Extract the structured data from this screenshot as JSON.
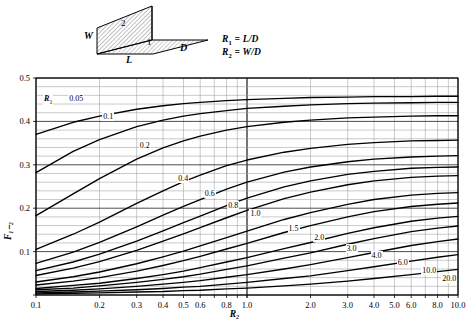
{
  "schematic": {
    "labels": [
      {
        "name": "width-label",
        "text": "W",
        "x": 88,
        "y": 31
      },
      {
        "name": "length-label",
        "text": "L",
        "x": 147,
        "y": 56
      },
      {
        "name": "depth-label",
        "text": "D",
        "x": 196,
        "y": 43
      },
      {
        "name": "surface-2-number",
        "text": "2",
        "x": 131,
        "y": 19
      },
      {
        "name": "surface-1-number",
        "text": "1",
        "x": 160,
        "y": 36
      }
    ],
    "equation_1": "R",
    "equation_1_sub": "1",
    "equation_1_rhs": " = L/D",
    "equation_2": "R",
    "equation_2_sub": "2",
    "equation_2_rhs": " = W/D",
    "hatch_color": "#7a7a7a",
    "outline_color": "#000000"
  },
  "chart_data": {
    "type": "line",
    "title": "",
    "xlabel": "R₂",
    "ylabel": "F₁₋₂",
    "xscale": "log",
    "yscale": "linear",
    "xlim": [
      0.1,
      10.0
    ],
    "ylim": [
      0.0,
      0.5
    ],
    "grid": true,
    "legend_position": "inline-curve-labels",
    "x_tick_labels": [
      "0.1",
      "0.2",
      "0.3",
      "0.4",
      "0.5",
      "0.6",
      "0.8",
      "1.0",
      "2.0",
      "3.0",
      "4.0",
      "5.0",
      "6.0",
      "8.0",
      "10.0"
    ],
    "x_tick_values": [
      0.1,
      0.2,
      0.3,
      0.4,
      0.5,
      0.6,
      0.8,
      1.0,
      2.0,
      3.0,
      4.0,
      5.0,
      6.0,
      8.0,
      10.0
    ],
    "y_tick_labels": [
      "0",
      "0.1",
      "0.2",
      "0.3",
      "0.4",
      "0.5"
    ],
    "y_tick_values": [
      0,
      0.1,
      0.2,
      0.3,
      0.4,
      0.5
    ],
    "y_minor_step": 0.02,
    "parameter_name": "R₁",
    "series": [
      {
        "name": "0.05",
        "R1": 0.05,
        "label": "0.05",
        "label_x": 0.155,
        "label_y": 0.452,
        "x": [
          0.1,
          0.15,
          0.2,
          0.3,
          0.4,
          0.5,
          0.6,
          0.8,
          1.0,
          1.5,
          2.0,
          3.0,
          4.0,
          6.0,
          8.0,
          10.0
        ],
        "values": [
          0.37,
          0.398,
          0.412,
          0.428,
          0.436,
          0.441,
          0.444,
          0.448,
          0.45,
          0.453,
          0.455,
          0.456,
          0.457,
          0.457,
          0.458,
          0.458
        ]
      },
      {
        "name": "0.1",
        "R1": 0.1,
        "label": "0.1",
        "label_x": 0.225,
        "label_y": 0.41,
        "x": [
          0.1,
          0.15,
          0.2,
          0.3,
          0.4,
          0.5,
          0.6,
          0.8,
          1.0,
          1.5,
          2.0,
          3.0,
          4.0,
          6.0,
          8.0,
          10.0
        ],
        "values": [
          0.282,
          0.331,
          0.358,
          0.388,
          0.403,
          0.412,
          0.418,
          0.425,
          0.43,
          0.435,
          0.438,
          0.441,
          0.442,
          0.443,
          0.444,
          0.444
        ]
      },
      {
        "name": "0.2",
        "R1": 0.2,
        "label": "0.2",
        "label_x": 0.335,
        "label_y": 0.344,
        "x": [
          0.1,
          0.15,
          0.2,
          0.3,
          0.4,
          0.5,
          0.6,
          0.8,
          1.0,
          1.5,
          2.0,
          3.0,
          4.0,
          6.0,
          8.0,
          10.0
        ],
        "values": [
          0.183,
          0.233,
          0.268,
          0.313,
          0.339,
          0.355,
          0.366,
          0.38,
          0.388,
          0.398,
          0.403,
          0.408,
          0.41,
          0.412,
          0.413,
          0.413
        ]
      },
      {
        "name": "0.4",
        "R1": 0.4,
        "label": "0.4",
        "label_x": 0.51,
        "label_y": 0.268,
        "x": [
          0.1,
          0.15,
          0.2,
          0.3,
          0.4,
          0.5,
          0.6,
          0.8,
          1.0,
          1.5,
          2.0,
          3.0,
          4.0,
          6.0,
          8.0,
          10.0
        ],
        "values": [
          0.105,
          0.14,
          0.168,
          0.211,
          0.24,
          0.261,
          0.276,
          0.298,
          0.311,
          0.329,
          0.338,
          0.347,
          0.351,
          0.355,
          0.356,
          0.357
        ]
      },
      {
        "name": "0.6",
        "R1": 0.6,
        "label": "0.6",
        "label_x": 0.68,
        "label_y": 0.232,
        "x": [
          0.1,
          0.15,
          0.2,
          0.3,
          0.4,
          0.5,
          0.6,
          0.8,
          1.0,
          1.5,
          2.0,
          3.0,
          4.0,
          6.0,
          8.0,
          10.0
        ],
        "values": [
          0.073,
          0.099,
          0.121,
          0.157,
          0.184,
          0.204,
          0.22,
          0.244,
          0.26,
          0.283,
          0.295,
          0.307,
          0.313,
          0.318,
          0.32,
          0.321
        ]
      },
      {
        "name": "0.8",
        "R1": 0.8,
        "label": "0.8",
        "label_x": 0.88,
        "label_y": 0.205,
        "x": [
          0.1,
          0.15,
          0.2,
          0.3,
          0.4,
          0.5,
          0.6,
          0.8,
          1.0,
          1.5,
          2.0,
          3.0,
          4.0,
          6.0,
          8.0,
          10.0
        ],
        "values": [
          0.056,
          0.076,
          0.094,
          0.124,
          0.148,
          0.167,
          0.182,
          0.206,
          0.223,
          0.249,
          0.263,
          0.278,
          0.285,
          0.292,
          0.294,
          0.295
        ]
      },
      {
        "name": "1.0",
        "R1": 1.0,
        "label": "1.0",
        "label_x": 1.12,
        "label_y": 0.186,
        "x": [
          0.1,
          0.15,
          0.2,
          0.3,
          0.4,
          0.5,
          0.6,
          0.8,
          1.0,
          1.5,
          2.0,
          3.0,
          4.0,
          6.0,
          8.0,
          10.0
        ],
        "values": [
          0.045,
          0.062,
          0.077,
          0.103,
          0.124,
          0.141,
          0.155,
          0.178,
          0.195,
          0.222,
          0.237,
          0.254,
          0.263,
          0.271,
          0.274,
          0.275
        ]
      },
      {
        "name": "1.5",
        "R1": 1.5,
        "label": "1.5",
        "label_x": 1.7,
        "label_y": 0.152,
        "x": [
          0.1,
          0.15,
          0.2,
          0.3,
          0.4,
          0.5,
          0.6,
          0.8,
          1.0,
          1.5,
          2.0,
          3.0,
          4.0,
          6.0,
          8.0,
          10.0
        ],
        "values": [
          0.03,
          0.042,
          0.053,
          0.072,
          0.088,
          0.101,
          0.113,
          0.132,
          0.147,
          0.174,
          0.19,
          0.209,
          0.22,
          0.23,
          0.234,
          0.236
        ]
      },
      {
        "name": "2.0",
        "R1": 2.0,
        "label": "2.0",
        "label_x": 2.25,
        "label_y": 0.132,
        "x": [
          0.1,
          0.15,
          0.2,
          0.3,
          0.4,
          0.5,
          0.6,
          0.8,
          1.0,
          1.5,
          2.0,
          3.0,
          4.0,
          6.0,
          8.0,
          10.0
        ],
        "values": [
          0.023,
          0.032,
          0.04,
          0.055,
          0.068,
          0.079,
          0.089,
          0.106,
          0.119,
          0.144,
          0.16,
          0.18,
          0.192,
          0.204,
          0.209,
          0.212
        ]
      },
      {
        "name": "3.0",
        "R1": 3.0,
        "label": "3.0",
        "label_x": 3.2,
        "label_y": 0.107,
        "x": [
          0.1,
          0.15,
          0.2,
          0.3,
          0.4,
          0.5,
          0.6,
          0.8,
          1.0,
          1.5,
          2.0,
          3.0,
          4.0,
          6.0,
          8.0,
          10.0
        ],
        "values": [
          0.015,
          0.022,
          0.027,
          0.038,
          0.047,
          0.055,
          0.063,
          0.076,
          0.086,
          0.107,
          0.121,
          0.142,
          0.155,
          0.17,
          0.177,
          0.181
        ]
      },
      {
        "name": "4.0",
        "R1": 4.0,
        "label": "4.0",
        "label_x": 4.2,
        "label_y": 0.091,
        "x": [
          0.1,
          0.15,
          0.2,
          0.3,
          0.4,
          0.5,
          0.6,
          0.8,
          1.0,
          1.5,
          2.0,
          3.0,
          4.0,
          6.0,
          8.0,
          10.0
        ],
        "values": [
          0.012,
          0.016,
          0.021,
          0.029,
          0.036,
          0.042,
          0.048,
          0.059,
          0.067,
          0.085,
          0.097,
          0.117,
          0.13,
          0.146,
          0.154,
          0.159
        ]
      },
      {
        "name": "6.0",
        "R1": 6.0,
        "label": "6.0",
        "label_x": 5.6,
        "label_y": 0.073,
        "x": [
          0.1,
          0.15,
          0.2,
          0.3,
          0.4,
          0.5,
          0.6,
          0.8,
          1.0,
          1.5,
          2.0,
          3.0,
          4.0,
          6.0,
          8.0,
          10.0
        ],
        "values": [
          0.008,
          0.011,
          0.014,
          0.02,
          0.025,
          0.029,
          0.033,
          0.041,
          0.047,
          0.06,
          0.07,
          0.086,
          0.098,
          0.114,
          0.123,
          0.129
        ]
      },
      {
        "name": "10.0",
        "R1": 10.0,
        "label": "10.0",
        "label_x": 7.3,
        "label_y": 0.055,
        "x": [
          0.1,
          0.15,
          0.2,
          0.3,
          0.4,
          0.5,
          0.6,
          0.8,
          1.0,
          1.5,
          2.0,
          3.0,
          4.0,
          6.0,
          8.0,
          10.0
        ],
        "values": [
          0.005,
          0.007,
          0.009,
          0.012,
          0.015,
          0.018,
          0.02,
          0.025,
          0.029,
          0.038,
          0.044,
          0.056,
          0.065,
          0.078,
          0.087,
          0.093
        ]
      },
      {
        "name": "20.0",
        "R1": 20.0,
        "label": "20.0",
        "label_x": 9.1,
        "label_y": 0.037,
        "x": [
          0.1,
          0.15,
          0.2,
          0.3,
          0.4,
          0.5,
          0.6,
          0.8,
          1.0,
          1.5,
          2.0,
          3.0,
          4.0,
          6.0,
          8.0,
          10.0
        ],
        "values": [
          0.0025,
          0.004,
          0.005,
          0.007,
          0.008,
          0.01,
          0.011,
          0.014,
          0.016,
          0.021,
          0.025,
          0.032,
          0.038,
          0.047,
          0.054,
          0.059
        ]
      }
    ]
  }
}
